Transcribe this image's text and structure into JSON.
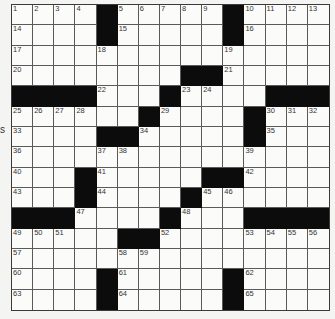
{
  "puzzle": {
    "rows": 15,
    "cols": 15,
    "side_mark": "s",
    "colors": {
      "block": "#0c0c0c",
      "cell": "#fbfbfa",
      "line": "#5a5a5a",
      "background": "#f4f4f2"
    },
    "grid": [
      "1 2 3 4 # 5 6 7 8 9 # 10 11 12 13",
      "14 . . . # 15 . . . . # 16 . . .",
      "17 . . . 18 . . . . . 19 . . . .",
      "20 . . . . . . . # # 21 . . . .",
      "# # # # 22 . . # 23 24 . . # # #",
      "25 26 27 28 . . # 29 . . . # 30 31 32",
      "33 . . . # # 34 . . . . # 35 . .",
      "36 . . . 37 38 . . . . . 39 . . .",
      "40 . . # 41 . . . . # # 42 . . .",
      "43 . . # 44 . . . # 45 46 . . . .",
      "# # # 47 . . . # 48 . . # # # #",
      "49 50 51 . . # # 52 . . . 53 54 55 56",
      "57 . . . . 58 59 . . . . . . . .",
      "60 . . . # 61 . . . . # 62 . . .",
      "63 . . . # 64 . . . . # 65 . . ."
    ]
  }
}
